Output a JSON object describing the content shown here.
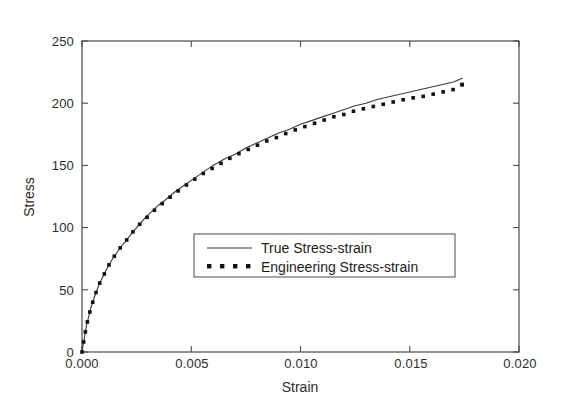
{
  "chart_data": {
    "type": "line",
    "title": "",
    "xlabel": "Strain",
    "ylabel": "Stress",
    "xlim": [
      0.0,
      0.02
    ],
    "ylim": [
      0,
      250
    ],
    "grid": false,
    "legend_position": "center",
    "xticks": [
      "0.000",
      "0.005",
      "0.010",
      "0.015",
      "0.020"
    ],
    "xtick_values": [
      0.0,
      0.005,
      0.01,
      0.015,
      0.02
    ],
    "yticks": [
      "0",
      "50",
      "100",
      "150",
      "200",
      "250"
    ],
    "ytick_values": [
      0,
      50,
      100,
      150,
      200,
      250
    ],
    "x": [
      0.0,
      0.0002,
      0.0004,
      0.0006,
      0.0008,
      0.001,
      0.0012,
      0.0014,
      0.0016,
      0.0018,
      0.002,
      0.0023,
      0.0026,
      0.0029,
      0.0032,
      0.0035,
      0.0038,
      0.0042,
      0.0046,
      0.005,
      0.0055,
      0.006,
      0.0065,
      0.007,
      0.0075,
      0.008,
      0.0085,
      0.009,
      0.0095,
      0.01,
      0.0105,
      0.011,
      0.0115,
      0.012,
      0.0125,
      0.013,
      0.0135,
      0.014,
      0.0145,
      0.015,
      0.0155,
      0.016,
      0.0165,
      0.017,
      0.0174
    ],
    "series": [
      {
        "name": "True Stress-strain",
        "style": "solid-line",
        "color": "#3a3a3a",
        "values": [
          0,
          21,
          35,
          46,
          55,
          62,
          69,
          75,
          80,
          85,
          89,
          96,
          102,
          108,
          113,
          118,
          122,
          128,
          133,
          138,
          144,
          150,
          155,
          159,
          164,
          168,
          172,
          176,
          179,
          183,
          186,
          189,
          192,
          195,
          198,
          200,
          203,
          205,
          207,
          209,
          211,
          213,
          215,
          217,
          220
        ]
      },
      {
        "name": "Engineering Stress-strain",
        "style": "dotted-square-markers",
        "color": "#111111",
        "values": [
          0,
          21,
          35,
          46,
          55,
          62,
          69,
          75,
          80,
          85,
          89,
          96,
          102,
          107,
          112,
          117,
          121,
          127,
          132,
          137,
          143,
          148,
          153,
          158,
          162,
          166,
          170,
          173,
          177,
          180,
          183,
          186,
          189,
          191,
          194,
          196,
          198,
          200,
          202,
          204,
          205,
          207,
          209,
          211,
          215
        ]
      }
    ]
  },
  "legend": {
    "entries": [
      {
        "label": "True Stress-strain"
      },
      {
        "label": "Engineering Stress-strain"
      }
    ]
  }
}
